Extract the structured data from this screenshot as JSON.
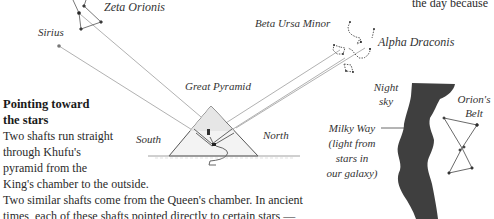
{
  "top_right_fragment": "the day because",
  "labels": {
    "zeta_orionis": "Zeta Orionis",
    "sirius": "Sirius",
    "beta_ursa_minor": "Beta Ursa Minor",
    "alpha_draconis": "Alpha Draconis",
    "great_pyramid": "Great Pyramid",
    "south": "South",
    "north": "North",
    "night_sky_1": "Night",
    "night_sky_2": "sky",
    "orions_belt_1": "Orion's",
    "orions_belt_2": "Belt",
    "milky_way": [
      "Milky Way",
      "(light from",
      "stars in",
      "our galaxy)"
    ]
  },
  "section": {
    "heading": [
      "Pointing toward",
      "the stars"
    ],
    "body_lines": [
      "Two shafts run straight",
      "through Khufu's",
      "pyramid from the",
      "King's chamber to the outside.",
      "Two similar shafts come from the Queen's chamber. In ancient",
      "times, each of these shafts pointed directly to certain stars —"
    ]
  },
  "colors": {
    "milky_way": "#3c3c3c",
    "lines": "#9a9a9a",
    "stars": "#222222"
  }
}
